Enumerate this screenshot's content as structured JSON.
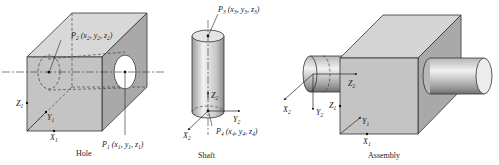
{
  "figure": {
    "colors": {
      "front_face": "#c4c4c4",
      "top_face": "#d8d8d8",
      "side_face": "#a9a9a9",
      "outline": "#333333",
      "hole": "#ffffff",
      "shaft_light": "#eeeeee",
      "shaft_dark": "#8e8e8e"
    },
    "panels": [
      {
        "id": "hole",
        "caption": "Hole",
        "labels": {
          "p2": {
            "name": "P",
            "sub": "2",
            "coords": [
              "x",
              "2",
              "y",
              "2",
              "z",
              "2"
            ]
          },
          "p1": {
            "name": "P",
            "sub": "1",
            "coords": [
              "x",
              "1",
              "y",
              "1",
              "z",
              "1"
            ]
          },
          "z_axis": {
            "name": "Z",
            "sub": "1"
          },
          "y_axis": {
            "name": "Y",
            "sub": "1"
          },
          "x_axis": {
            "name": "X",
            "sub": "1"
          }
        }
      },
      {
        "id": "shaft",
        "caption": "Shaft",
        "labels": {
          "p3": {
            "name": "P",
            "sub": "3",
            "coords": [
              "x",
              "3",
              "y",
              "3",
              "z",
              "3"
            ]
          },
          "p4": {
            "name": "P",
            "sub": "4",
            "coords": [
              "x",
              "4",
              "y",
              "4",
              "z",
              "4"
            ]
          },
          "z_axis": {
            "name": "Z",
            "sub": "2"
          },
          "y_axis": {
            "name": "Y",
            "sub": "2"
          },
          "x_axis": {
            "name": "X",
            "sub": "2"
          }
        }
      },
      {
        "id": "assembly",
        "caption": "Assembly",
        "labels": {
          "z2_axis": {
            "name": "Z",
            "sub": "2"
          },
          "x2_axis": {
            "name": "X",
            "sub": "2"
          },
          "y2_axis": {
            "name": "Y",
            "sub": "2"
          },
          "z1_axis": {
            "name": "Z",
            "sub": "1"
          },
          "y1_axis": {
            "name": "Y",
            "sub": "1"
          },
          "x1_axis": {
            "name": "X",
            "sub": "1"
          }
        }
      }
    ]
  }
}
